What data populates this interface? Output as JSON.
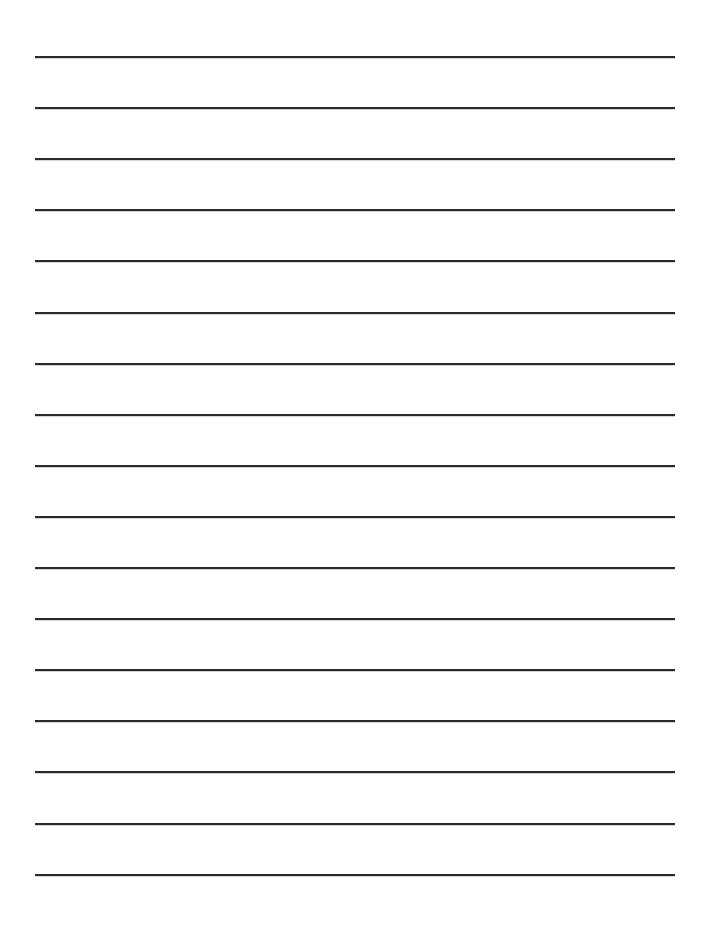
{
  "page": {
    "type": "lined-paper",
    "background_color": "#ffffff",
    "line_color": "#2a2a2a",
    "line_count": 17,
    "first_line_y": 56,
    "line_spacing": 51.1,
    "line_left": 35,
    "line_width": 640,
    "line_thickness": 2
  }
}
